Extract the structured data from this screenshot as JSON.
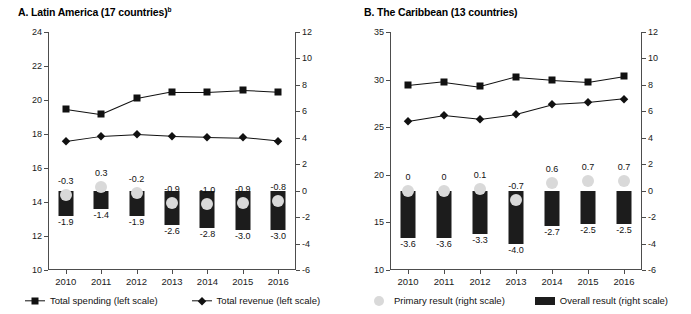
{
  "figure": {
    "background": "#ffffff",
    "series_color_dark": "#111111",
    "series_color_light": "#d9d9d9"
  },
  "panels": [
    {
      "id": "panel-a",
      "title_main": "A. Latin America (17 countries)",
      "title_superscript": "b"
    },
    {
      "id": "panel-b",
      "title_main": "B. The Caribbean (13 countries)",
      "title_superscript": ""
    }
  ],
  "legend": {
    "spending": "Total spending (left scale)",
    "revenue": "Total revenue (left scale)",
    "primary": "Primary result (right scale)",
    "overall": "Overall result (right scale)"
  },
  "chart_data": [
    {
      "type": "line",
      "title": "A. Latin America (17 countries)",
      "xlabel": "",
      "ylabel": "",
      "categories": [
        "2010",
        "2011",
        "2012",
        "2013",
        "2014",
        "2015",
        "2016"
      ],
      "ylim": [
        10,
        24
      ],
      "yticks": [
        10,
        12,
        14,
        16,
        18,
        20,
        22,
        24
      ],
      "ylim_right": [
        -6,
        12
      ],
      "yticks_right": [
        -6,
        -4,
        -2,
        0,
        2,
        4,
        6,
        8,
        10,
        12
      ],
      "grid": false,
      "legend_position": "bottom",
      "series": [
        {
          "name": "Total spending (left scale)",
          "axis": "left",
          "marker": "square",
          "values": [
            19.5,
            19.2,
            20.1,
            20.5,
            20.5,
            20.6,
            20.5
          ]
        },
        {
          "name": "Total revenue (left scale)",
          "axis": "left",
          "marker": "diamond",
          "values": [
            17.6,
            17.9,
            18.0,
            17.9,
            17.85,
            17.8,
            17.6
          ]
        },
        {
          "name": "Primary result (right scale)",
          "axis": "right",
          "marker": "circle",
          "values": [
            -0.3,
            0.3,
            -0.2,
            -0.9,
            -1.0,
            -0.9,
            -0.8
          ],
          "labels": [
            "-0.3",
            "0.3",
            "-0.2",
            "-0.9",
            "-1.0",
            "-0.9",
            "-0.8"
          ]
        },
        {
          "name": "Overall result (right scale)",
          "axis": "right",
          "marker": "bar",
          "values": [
            -1.9,
            -1.4,
            -1.9,
            -2.6,
            -2.8,
            -3.0,
            -3.0
          ],
          "labels": [
            "-1.9",
            "-1.4",
            "-1.9",
            "-2.6",
            "-2.8",
            "-3.0",
            "-3.0"
          ]
        }
      ]
    },
    {
      "type": "line",
      "title": "B. The Caribbean (13 countries)",
      "xlabel": "",
      "ylabel": "",
      "categories": [
        "2010",
        "2011",
        "2012",
        "2013",
        "2014",
        "2015",
        "2016"
      ],
      "ylim": [
        10,
        35
      ],
      "yticks": [
        10,
        15,
        20,
        25,
        30,
        35
      ],
      "ylim_right": [
        -6,
        12
      ],
      "yticks_right": [
        -6,
        -4,
        -2,
        0,
        2,
        4,
        6,
        8,
        10,
        12
      ],
      "grid": false,
      "legend_position": "bottom",
      "series": [
        {
          "name": "Total spending (left scale)",
          "axis": "left",
          "marker": "square",
          "values": [
            29.4,
            29.8,
            29.3,
            30.3,
            30.0,
            29.8,
            30.4
          ]
        },
        {
          "name": "Total revenue (left scale)",
          "axis": "left",
          "marker": "diamond",
          "values": [
            25.7,
            26.3,
            25.9,
            26.4,
            27.4,
            27.6,
            28.0
          ]
        },
        {
          "name": "Primary result (right scale)",
          "axis": "right",
          "marker": "circle",
          "values": [
            0,
            0,
            0.1,
            -0.7,
            0.6,
            0.7,
            0.7
          ],
          "labels": [
            "0",
            "0",
            "0.1",
            "-0.7",
            "0.6",
            "0.7",
            "0.7"
          ]
        },
        {
          "name": "Overall result (right scale)",
          "axis": "right",
          "marker": "bar",
          "values": [
            -3.6,
            -3.6,
            -3.3,
            -4.0,
            -2.7,
            -2.5,
            -2.5
          ],
          "labels": [
            "-3.6",
            "-3.6",
            "-3.3",
            "-4.0",
            "-2.7",
            "-2.5",
            "-2.5"
          ]
        }
      ]
    }
  ]
}
